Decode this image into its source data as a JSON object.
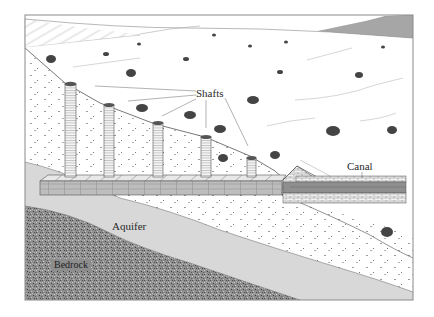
{
  "diagram": {
    "labels": {
      "shafts": "Shafts",
      "canal": "Canal",
      "aquifer": "Aquifer",
      "bedrock": "Bedrock"
    },
    "layers": [
      "Mountain / hills (hatched)",
      "Surface soil with shrubs",
      "Alluvial fill",
      "Aquifer",
      "Bedrock"
    ],
    "components": {
      "shaft_count": 5,
      "tunnel": "horizontal gallery linking shaft bases",
      "canal": "open masonry channel at outlet"
    },
    "colors": {
      "background": "#ffffff",
      "frame": "#8a8a8a",
      "aquifer": "#d6d6d6",
      "bedrock": "#8c8c8c",
      "mountain": "#9a9a9a",
      "line": "#555555"
    }
  }
}
